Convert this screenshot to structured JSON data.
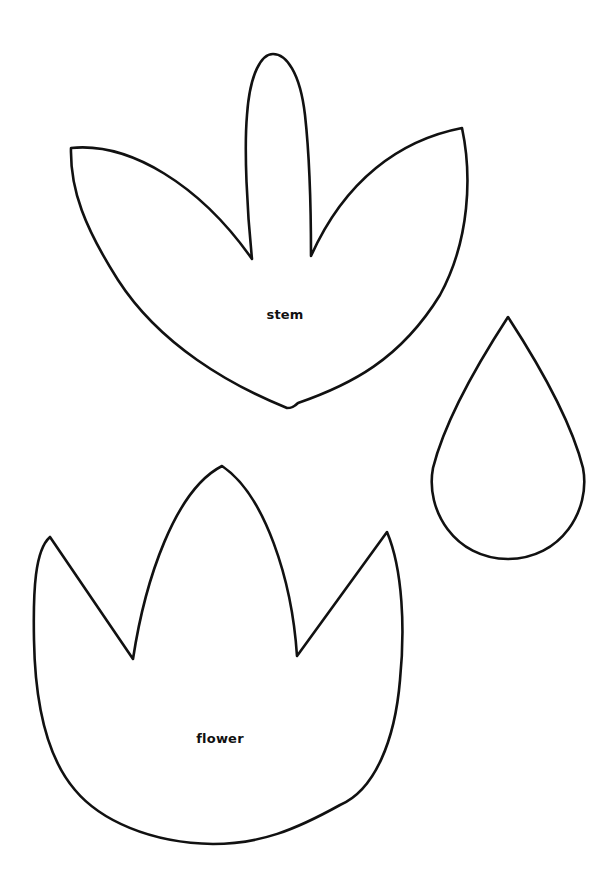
{
  "page": {
    "background": "#ffffff",
    "stroke_color": "#111111"
  },
  "shapes": [
    {
      "id": "stem",
      "label": "stem",
      "description": "three-leaf stem template"
    },
    {
      "id": "drop",
      "label": "",
      "description": "teardrop template"
    },
    {
      "id": "flower",
      "label": "flower",
      "description": "tulip flower template"
    }
  ]
}
